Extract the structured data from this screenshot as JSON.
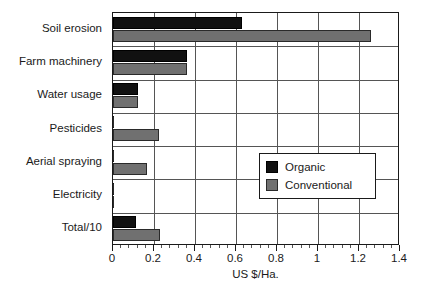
{
  "chart_data": {
    "type": "bar",
    "orientation": "horizontal",
    "title": "",
    "subtitle": "",
    "xlabel": "US $/Ha.",
    "ylabel": "",
    "xlim": [
      0,
      1.4
    ],
    "xticks": [
      "0",
      "0.2",
      "0.4",
      "0.6",
      "0.8",
      "1",
      "1.2",
      "1.4"
    ],
    "xtick_values": [
      0,
      0.2,
      0.4,
      0.6,
      0.8,
      1.0,
      1.2,
      1.4
    ],
    "minor_ticks_per_interval": 4,
    "grid": "vertical-and-horizontal",
    "legend_position": "center-right",
    "categories": [
      "Soil erosion",
      "Farm machinery",
      "Water usage",
      "Pesticides",
      "Aerial spraying",
      "Electricity",
      "Total/10"
    ],
    "series": [
      {
        "name": "Organic",
        "color": "#111111",
        "values": [
          0.63,
          0.36,
          0.12,
          0.0,
          0.0,
          0.0,
          0.11
        ]
      },
      {
        "name": "Conventional",
        "color": "#707070",
        "values": [
          1.26,
          0.36,
          0.12,
          0.225,
          0.165,
          0.0,
          0.23
        ]
      }
    ]
  },
  "legend": {
    "entries": [
      {
        "label": "Organic",
        "swatch": "organic"
      },
      {
        "label": "Conventional",
        "swatch": "conventional"
      }
    ]
  },
  "axis": {
    "x_title": "US $/Ha."
  },
  "colors": {
    "organic": "#111111",
    "conventional": "#707070",
    "axis": "#1a1a1a",
    "grid": "#555555",
    "background": "#ffffff"
  }
}
